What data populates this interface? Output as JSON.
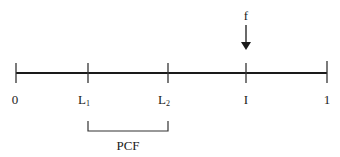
{
  "diagram": {
    "type": "number-line",
    "line_color": "#1a1a1a",
    "ticks": [
      {
        "id": "t0",
        "x": 16,
        "label": "0",
        "sub": ""
      },
      {
        "id": "tL1",
        "x": 88,
        "label": "L",
        "sub": "1"
      },
      {
        "id": "tL2",
        "x": 168,
        "label": "L",
        "sub": "2"
      },
      {
        "id": "tI",
        "x": 246,
        "label": "I",
        "sub": ""
      },
      {
        "id": "t1",
        "x": 327,
        "label": "1",
        "sub": ""
      }
    ],
    "bracket": {
      "from": "L1",
      "to": "L2",
      "label": "PCF"
    },
    "arrow": {
      "at": "I",
      "label": "f"
    }
  }
}
